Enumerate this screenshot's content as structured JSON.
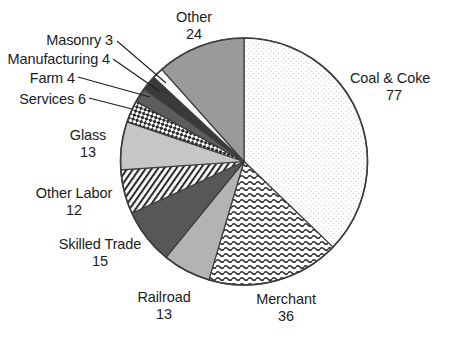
{
  "chart_data": {
    "type": "pie",
    "title": "",
    "total": 207,
    "start_angle_deg": 0,
    "direction": "clockwise",
    "categories": [
      "Coal & Coke",
      "Merchant",
      "Railroad",
      "Skilled Trade",
      "Other Labor",
      "Glass",
      "Services",
      "Farm",
      "Manufacturing",
      "Masonry",
      "Other"
    ],
    "values": [
      77,
      36,
      13,
      15,
      12,
      13,
      6,
      4,
      4,
      3,
      24
    ],
    "legend": "none",
    "grid": false,
    "xlabel": "",
    "ylabel": "",
    "slices": [
      {
        "label": "Coal & Coke",
        "value": 77,
        "fill": "dots-light",
        "color": "#fdfdfd",
        "label_layout": "two-line-left"
      },
      {
        "label": "Merchant",
        "value": 36,
        "fill": "waves",
        "color": "#ffffff",
        "label_layout": "two-line-center"
      },
      {
        "label": "Railroad",
        "value": 13,
        "fill": "solid",
        "color": "#b3b3b3",
        "label_layout": "two-line-center"
      },
      {
        "label": "Skilled Trade",
        "value": 15,
        "fill": "solid",
        "color": "#575757",
        "label_layout": "two-line-center"
      },
      {
        "label": "Other Labor",
        "value": 12,
        "fill": "diag-hatch",
        "color": "#ffffff",
        "label_layout": "two-line-center"
      },
      {
        "label": "Glass",
        "value": 13,
        "fill": "solid",
        "color": "#c6c6c6",
        "label_layout": "two-line-center"
      },
      {
        "label": "Services",
        "value": 6,
        "fill": "checks",
        "color": "#ffffff",
        "label_layout": "inline-leader"
      },
      {
        "label": "Farm",
        "value": 4,
        "fill": "solid",
        "color": "#5d5d5d",
        "label_layout": "inline-leader"
      },
      {
        "label": "Manufacturing",
        "value": 4,
        "fill": "solid",
        "color": "#3a3a3a",
        "label_layout": "inline-leader"
      },
      {
        "label": "Masonry",
        "value": 3,
        "fill": "solid",
        "color": "#ffffff",
        "label_layout": "inline-leader"
      },
      {
        "label": "Other",
        "value": 24,
        "fill": "solid",
        "color": "#9a9a9a",
        "label_layout": "two-line-center"
      }
    ]
  },
  "labels": {
    "coal_coke": {
      "name": "Coal & Coke",
      "value": "77"
    },
    "merchant": {
      "name": "Merchant",
      "value": "36"
    },
    "railroad": {
      "name": "Railroad",
      "value": "13"
    },
    "skilled_trade": {
      "name": "Skilled Trade",
      "value": "15"
    },
    "other_labor": {
      "name": "Other Labor",
      "value": "12"
    },
    "glass": {
      "name": "Glass",
      "value": "13"
    },
    "services": {
      "text": "Services  6"
    },
    "farm": {
      "text": "Farm  4"
    },
    "manufacturing": {
      "text": "Manufacturing  4"
    },
    "masonry": {
      "text": "Masonry  3"
    },
    "other": {
      "name": "Other",
      "value": "24"
    }
  },
  "style": {
    "outline_color": "#3d3d3d",
    "text_color": "#1c1c1c",
    "background": "#ffffff"
  }
}
